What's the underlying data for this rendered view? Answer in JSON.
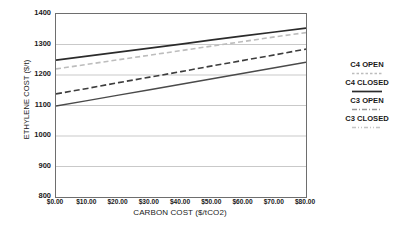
{
  "chart_data": {
    "type": "line",
    "title": "",
    "xlabel": "CARBON COST ($/tCO2)",
    "ylabel": "ETHYLENE COST ($/t)",
    "x": [
      0,
      10,
      20,
      30,
      40,
      50,
      60,
      70,
      80
    ],
    "xtick_labels": [
      "$0.00",
      "$10.00",
      "$20.00",
      "$30.00",
      "$40.00",
      "$50.00",
      "$60.00",
      "$70.00",
      "$80.00"
    ],
    "ytick_labels": [
      "1400",
      "1300",
      "1200",
      "1100",
      "1000",
      "900",
      "800"
    ],
    "yticks": [
      1400,
      1300,
      1200,
      1100,
      1000,
      900,
      800
    ],
    "xlim": [
      0,
      80
    ],
    "ylim": [
      800,
      1400
    ],
    "grid": "horizontal",
    "legend_position": "right",
    "series": [
      {
        "name": "C4 OPEN",
        "style": "dashed",
        "color": "#bdbdbd",
        "width": 1.6,
        "dash": "5,3",
        "values": [
          1220,
          1235,
          1250,
          1265,
          1280,
          1295,
          1310,
          1325,
          1339
        ]
      },
      {
        "name": "C4 CLOSED",
        "style": "solid",
        "color": "#2b2b2b",
        "width": 1.7,
        "dash": "",
        "values": [
          1249,
          1262,
          1275,
          1288,
          1301,
          1315,
          1328,
          1341,
          1354
        ]
      },
      {
        "name": "C3 OPEN",
        "style": "dashed",
        "color": "#3d3d3d",
        "width": 1.6,
        "dash": "6,3",
        "values": [
          1138,
          1156,
          1175,
          1193,
          1211,
          1230,
          1248,
          1266,
          1285
        ]
      },
      {
        "name": "C3 CLOSED",
        "style": "solid",
        "color": "#4a4a4a",
        "width": 1.5,
        "dash": "",
        "values": [
          1098,
          1116,
          1134,
          1152,
          1170,
          1188,
          1206,
          1224,
          1242
        ]
      }
    ]
  },
  "legend": {
    "entries": [
      {
        "label": "C4 OPEN"
      },
      {
        "label": "C4 CLOSED"
      },
      {
        "label": "C3 OPEN"
      },
      {
        "label": "C3 CLOSED"
      }
    ],
    "samples": [
      {
        "dash": "2.5,2",
        "color": "#bdbdbd",
        "width": 1.6
      },
      {
        "dash": "",
        "color": "#2b2b2b",
        "width": 1.7
      },
      {
        "dash": "5,2,1,2",
        "color": "#9a9a9a",
        "width": 1.4
      },
      {
        "dash": "4,2,1,2,1,2",
        "color": "#c4c4c4",
        "width": 1.3
      }
    ]
  },
  "colors": {
    "axis": "#6e6e6e",
    "grid": "#c9c9c9",
    "text": "#1a1a1a",
    "background": "#ffffff"
  }
}
